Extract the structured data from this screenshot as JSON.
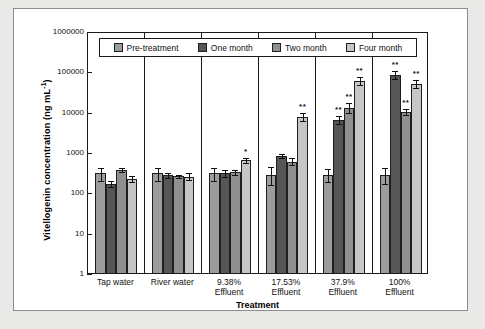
{
  "chart_data": {
    "type": "bar",
    "title": "",
    "xlabel": "Treatment",
    "ylabel": "Vitellogenin concentration (ng mL",
    "ylabel_sup": "-1",
    "ylabel_tail": ")",
    "yscale": "log",
    "ylim": [
      1,
      1000000
    ],
    "ytick_labels": [
      "1000000",
      "100000",
      "10000",
      "1000",
      "100",
      "10",
      "1"
    ],
    "ytick_values": [
      1000000,
      100000,
      10000,
      1000,
      100,
      10,
      1
    ],
    "grid": false,
    "legend_position": "top-inside",
    "categories": [
      "Tap water",
      "River water",
      "9.38%\nEffluent",
      "17.53%\nEffluent",
      "37.9%\nEffluent",
      "100%\nEffluent"
    ],
    "category_lines": [
      [
        "Tap water",
        ""
      ],
      [
        "River water",
        ""
      ],
      [
        "9.38%",
        "Effluent"
      ],
      [
        "17.53%",
        "Effluent"
      ],
      [
        "37.9%",
        "Effluent"
      ],
      [
        "100%",
        "Effluent"
      ]
    ],
    "series": [
      {
        "name": "Pre-treatment",
        "color": "#9c9c9c",
        "values": [
          330,
          330,
          330,
          300,
          300,
          300
        ],
        "err_low": [
          220,
          210,
          215,
          170,
          200,
          185
        ],
        "err_high": [
          460,
          460,
          460,
          480,
          430,
          450
        ],
        "sig": [
          "",
          "",
          "",
          "",
          "",
          ""
        ]
      },
      {
        "name": "One month",
        "color": "#565656",
        "values": [
          180,
          300,
          330,
          900,
          7000,
          90000
        ],
        "err_low": [
          150,
          260,
          270,
          790,
          5600,
          72000
        ],
        "err_high": [
          215,
          345,
          410,
          1020,
          8600,
          112000
        ],
        "sig": [
          "",
          "",
          "",
          "",
          "**",
          "**"
        ]
      },
      {
        "name": "Two month",
        "color": "#8f8f8f",
        "values": [
          400,
          280,
          350,
          650,
          14000,
          11000
        ],
        "err_low": [
          355,
          255,
          300,
          530,
          10400,
          9200
        ],
        "err_high": [
          450,
          305,
          410,
          790,
          18500,
          13200
        ],
        "sig": [
          "",
          "",
          "",
          "",
          "**",
          "**"
        ]
      },
      {
        "name": "Four month",
        "color": "#c6c6c6",
        "values": [
          240,
          270,
          700,
          8500,
          65000,
          55000
        ],
        "err_low": [
          205,
          225,
          610,
          6700,
          52000,
          44000
        ],
        "err_high": [
          290,
          330,
          800,
          10600,
          82000,
          69000
        ],
        "sig": [
          "",
          "",
          "*",
          "**",
          "**",
          "**"
        ]
      }
    ]
  },
  "legend": {
    "items": [
      {
        "label": "Pre-treatment",
        "color": "#9c9c9c"
      },
      {
        "label": "One month",
        "color": "#565656"
      },
      {
        "label": "Two month",
        "color": "#8f8f8f"
      },
      {
        "label": "Four month",
        "color": "#c6c6c6"
      }
    ]
  },
  "axes": {
    "x_title": "Treatment",
    "y_title_main": "Vitellogenin concentration (ng mL",
    "y_title_sup": "-1",
    "y_title_end": ")"
  }
}
